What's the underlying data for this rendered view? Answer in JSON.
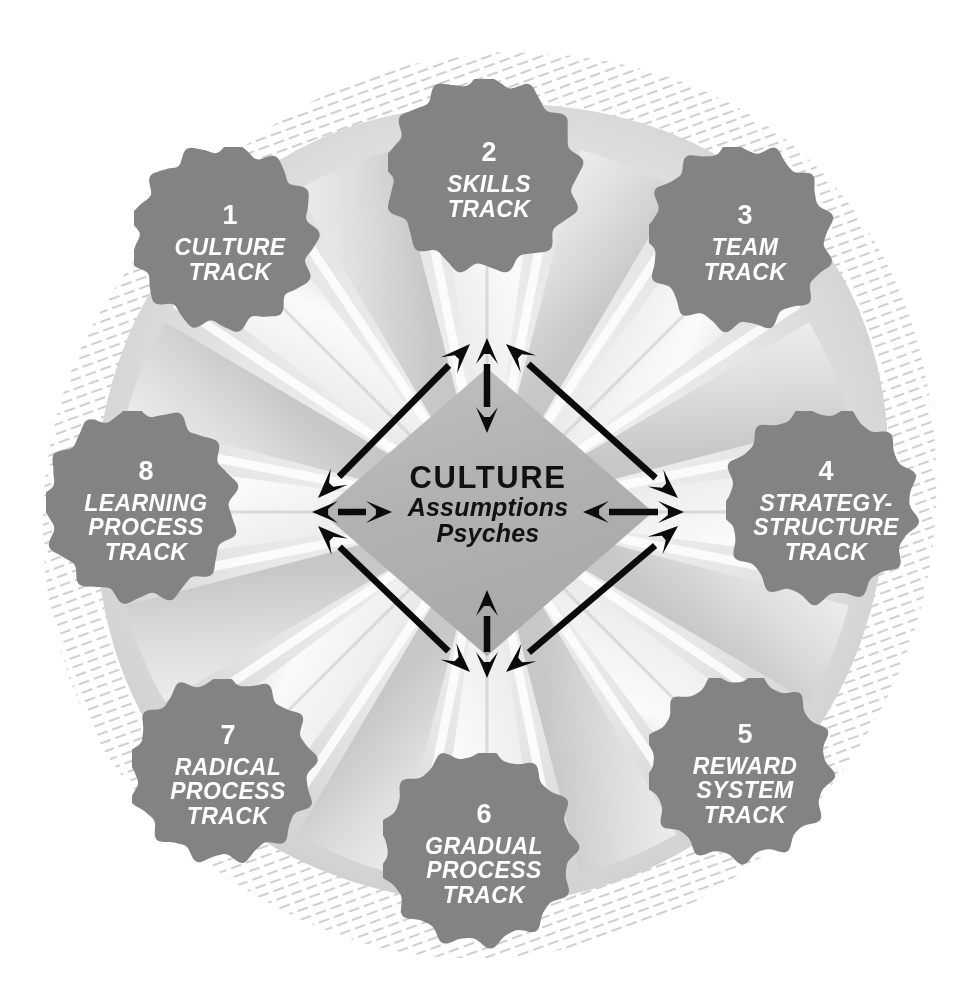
{
  "diagram": {
    "center": {
      "title": "CULTURE",
      "line2": "Assumptions",
      "line3": "Psyches"
    },
    "colors": {
      "blob": "#838383",
      "blob_dark": "#7a7a7a",
      "petal_light": "#f4f4f4",
      "petal_mid": "#dedede",
      "petal_shadow": "#c7c7c7",
      "center_diamond": "#b6b6b6",
      "arrow": "#0b0b0b",
      "hatch": "#c9c9c9",
      "node_text": "#ffffff",
      "center_text": "#111111",
      "background": "#ffffff"
    },
    "nodes": [
      {
        "number": "1",
        "lines": [
          "CULTURE",
          "TRACK"
        ],
        "cx": 230,
        "cy": 243,
        "r": 96
      },
      {
        "number": "2",
        "lines": [
          "SKILLS",
          "TRACK"
        ],
        "cx": 489,
        "cy": 180,
        "r": 101
      },
      {
        "number": "3",
        "lines": [
          "TEAM",
          "TRACK"
        ],
        "cx": 745,
        "cy": 243,
        "r": 96
      },
      {
        "number": "4",
        "lines": [
          "STRATEGY-",
          "STRUCTURE",
          "TRACK"
        ],
        "cx": 826,
        "cy": 511,
        "r": 100
      },
      {
        "number": "5",
        "lines": [
          "REWARD",
          "SYSTEM",
          "TRACK"
        ],
        "cx": 745,
        "cy": 774,
        "r": 96
      },
      {
        "number": "6",
        "lines": [
          "GRADUAL",
          "PROCESS",
          "TRACK"
        ],
        "cx": 484,
        "cy": 854,
        "r": 101
      },
      {
        "number": "7",
        "lines": [
          "RADICAL",
          "PROCESS",
          "TRACK"
        ],
        "cx": 228,
        "cy": 775,
        "r": 96
      },
      {
        "number": "8",
        "lines": [
          "LEARNING",
          "PROCESS",
          "TRACK"
        ],
        "cx": 146,
        "cy": 511,
        "r": 100
      }
    ],
    "arrows": {
      "style": "double-headed",
      "diamond_vertices": {
        "top": [
          488,
          334
        ],
        "right": [
          686,
          512
        ],
        "bottom": [
          488,
          682
        ],
        "left": [
          310,
          512
        ]
      },
      "long_edges": 4,
      "short_radials": 4
    }
  }
}
